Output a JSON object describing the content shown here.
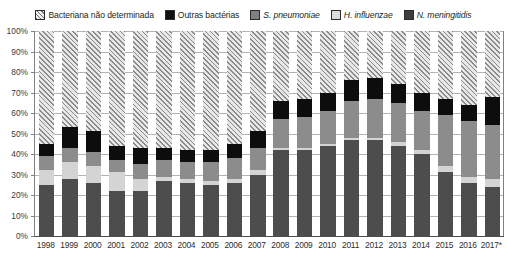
{
  "legend": {
    "position": "top",
    "items": [
      {
        "key": "bnd",
        "label": "Bacteriana não determinada",
        "color": "#e8e8e8",
        "pattern": "diagonal-hatch",
        "italic": false
      },
      {
        "key": "ob",
        "label": "Outras bactérias",
        "color": "#0d0d0d",
        "pattern": "solid",
        "italic": false
      },
      {
        "key": "sp",
        "label": "S. pneumoniae",
        "color": "#8c8c8c",
        "pattern": "solid",
        "italic": true
      },
      {
        "key": "hi",
        "label": "H. influenzae",
        "color": "#d4d4d4",
        "pattern": "solid",
        "italic": true
      },
      {
        "key": "nm",
        "label": "N. meningitidis",
        "color": "#4d4d4d",
        "pattern": "solid",
        "italic": true
      }
    ]
  },
  "chart_data": {
    "type": "bar",
    "stacked": true,
    "stack_total": 100,
    "title": "",
    "subtitle": "",
    "xlabel": "",
    "ylabel": "",
    "ylim": [
      0,
      100
    ],
    "yticks": [
      "0%",
      "10%",
      "20%",
      "30%",
      "40%",
      "50%",
      "60%",
      "70%",
      "80%",
      "90%",
      "100%"
    ],
    "grid": true,
    "legend_position": "top",
    "categories": [
      "1998",
      "1999",
      "2000",
      "2001",
      "2002",
      "2003",
      "2004",
      "2005",
      "2006",
      "2007",
      "2008",
      "2009",
      "2010",
      "2011",
      "2012",
      "2013",
      "2014",
      "2015",
      "2016",
      "2017*"
    ],
    "series": [
      {
        "name": "N. meningitidis",
        "key": "nm",
        "color": "#4d4d4d",
        "values": [
          25,
          28,
          26,
          22,
          22,
          27,
          26,
          25,
          26,
          30,
          42,
          42,
          44,
          47,
          47,
          44,
          40,
          31,
          26,
          24
        ]
      },
      {
        "name": "H. influenzae",
        "key": "hi",
        "color": "#d4d4d4",
        "values": [
          7,
          8,
          8,
          9,
          6,
          2,
          2,
          2,
          2,
          2,
          1,
          1,
          1,
          1,
          1,
          2,
          2,
          3,
          3,
          4
        ]
      },
      {
        "name": "S. pneumoniae",
        "key": "sp",
        "color": "#8c8c8c",
        "values": [
          7,
          7,
          7,
          6,
          7,
          8,
          8,
          9,
          10,
          11,
          14,
          15,
          16,
          18,
          19,
          19,
          19,
          25,
          27,
          26
        ]
      },
      {
        "name": "Outras bactérias",
        "key": "ob",
        "color": "#0d0d0d",
        "values": [
          6,
          10,
          10,
          7,
          8,
          6,
          6,
          6,
          7,
          8,
          9,
          9,
          9,
          10,
          10,
          9,
          9,
          8,
          8,
          14
        ]
      },
      {
        "name": "Bacteriana não determinada",
        "key": "bnd",
        "color": "#e8e8e8",
        "values": [
          55,
          47,
          49,
          56,
          57,
          57,
          58,
          58,
          55,
          49,
          34,
          33,
          30,
          24,
          23,
          26,
          30,
          33,
          36,
          32
        ]
      }
    ],
    "footnote_marker": "*"
  }
}
